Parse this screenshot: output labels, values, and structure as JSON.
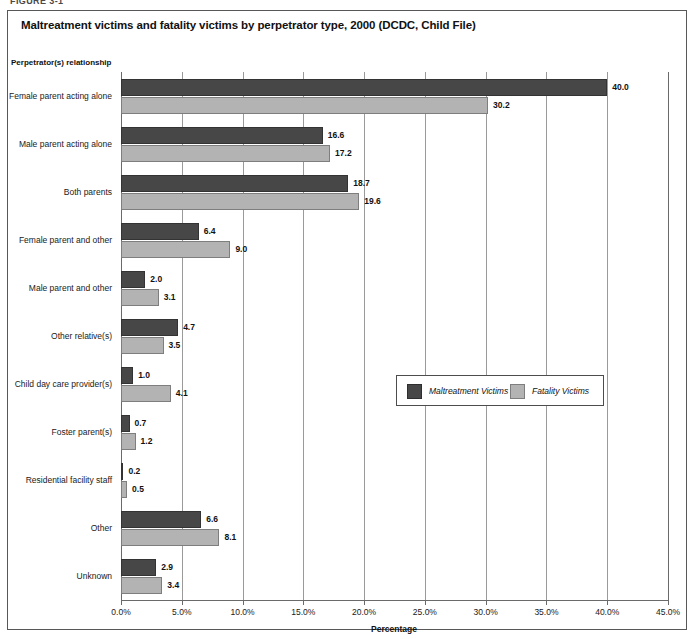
{
  "scan_artifact_top": "FIGURE 3-1",
  "figure": {
    "title": "Maltreatment victims and fatality victims by perpetrator type, 2000 (DCDC, Child File)",
    "y_axis_title": "Perpetrator(s) relationship",
    "x_axis_title": "Percentage"
  },
  "legend": {
    "items": [
      {
        "label": "Maltreatment Victims",
        "color": "#474747"
      },
      {
        "label": "Fatality Victims",
        "color": "#b3b3b3"
      }
    ]
  },
  "chart_data": {
    "type": "bar",
    "orientation": "horizontal",
    "title": "Maltreatment victims and fatality victims by perpetrator type, 2000 (DCDC, Child File)",
    "xlabel": "Percentage",
    "ylabel": "Perpetrator(s) relationship",
    "xlim": [
      0,
      45
    ],
    "xticks": [
      0,
      5,
      10,
      15,
      20,
      25,
      30,
      35,
      40,
      45
    ],
    "xtick_labels": [
      "0.0%",
      "5.0%",
      "10.0%",
      "15.0%",
      "20.0%",
      "25.0%",
      "30.0%",
      "35.0%",
      "40.0%",
      "45.0%"
    ],
    "grid": true,
    "legend_position": "center-right-inside",
    "categories": [
      "Female parent acting alone",
      "Male parent acting alone",
      "Both parents",
      "Female parent and other",
      "Male parent and other",
      "Other relative(s)",
      "Child day care provider(s)",
      "Foster parent(s)",
      "Residential facility staff",
      "Other",
      "Unknown"
    ],
    "series": [
      {
        "name": "Maltreatment Victims",
        "color": "#474747",
        "values": [
          40.0,
          16.6,
          18.7,
          6.4,
          2.0,
          4.7,
          1.0,
          0.7,
          0.2,
          6.6,
          2.9
        ],
        "labels": [
          "40.0",
          "16.6",
          "18.7",
          "6.4",
          "2.0",
          "4.7",
          "1.0",
          "0.7",
          "0.2",
          "6.6",
          "2.9"
        ]
      },
      {
        "name": "Fatality Victims",
        "color": "#b3b3b3",
        "values": [
          30.2,
          17.2,
          19.6,
          9.0,
          3.1,
          3.5,
          4.1,
          1.2,
          0.5,
          8.1,
          3.4
        ],
        "labels": [
          "30.2",
          "17.2",
          "19.6",
          "9.0",
          "3.1",
          "3.5",
          "4.1",
          "1.2",
          "0.5",
          "8.1",
          "3.4"
        ]
      }
    ]
  }
}
